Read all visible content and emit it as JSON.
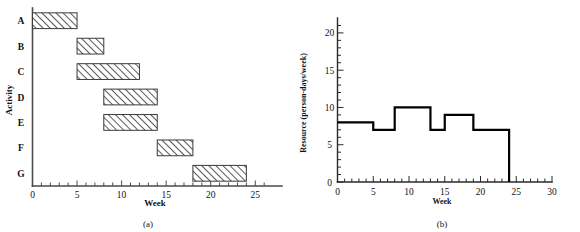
{
  "figure": {
    "panel_a_caption": "(a)",
    "panel_b_caption": "(b)"
  },
  "chart_data": [
    {
      "type": "bar",
      "orientation": "horizontal",
      "subtype": "gantt",
      "title": "",
      "caption": "(a)",
      "xlabel": "Week",
      "ylabel": "Activity",
      "xlim": [
        0,
        28
      ],
      "ylim": [
        0,
        7
      ],
      "grid": false,
      "legend": null,
      "x_ticks_major": [
        0,
        5,
        10,
        15,
        20,
        25
      ],
      "x_tick_labels": [
        "0",
        "5",
        "10",
        "15",
        "20",
        "25"
      ],
      "x_tick_minor_step": 1,
      "categories": [
        "A",
        "B",
        "C",
        "D",
        "E",
        "F",
        "G"
      ],
      "bars": [
        {
          "activity": "A",
          "start": 0,
          "end": 5,
          "duration": 5
        },
        {
          "activity": "B",
          "start": 5,
          "end": 8,
          "duration": 3
        },
        {
          "activity": "C",
          "start": 5,
          "end": 12,
          "duration": 7
        },
        {
          "activity": "D",
          "start": 8,
          "end": 14,
          "duration": 6
        },
        {
          "activity": "E",
          "start": 8,
          "end": 14,
          "duration": 6
        },
        {
          "activity": "F",
          "start": 14,
          "end": 18,
          "duration": 4
        },
        {
          "activity": "G",
          "start": 18,
          "end": 24,
          "duration": 6
        }
      ],
      "bar_fill": "hatched-diagonal",
      "bar_stroke_color": "#3a3a3a"
    },
    {
      "type": "line",
      "subtype": "step",
      "title": "",
      "caption": "(b)",
      "xlabel": "Week",
      "ylabel": "Resource (person-days/week)",
      "xlim": [
        0,
        30
      ],
      "ylim": [
        0,
        22
      ],
      "grid": false,
      "legend": null,
      "x_ticks_major": [
        0,
        5,
        10,
        15,
        20,
        25,
        30
      ],
      "x_tick_labels": [
        "0",
        "5",
        "10",
        "15",
        "20",
        "25",
        "30"
      ],
      "x_tick_minor_step": 1,
      "y_ticks_major": [
        0,
        5,
        10,
        15,
        20
      ],
      "y_tick_labels": [
        "0",
        "5",
        "10",
        "15",
        "20"
      ],
      "y_tick_minor_step": 1,
      "steps": [
        {
          "start": 0,
          "end": 5,
          "value": 8
        },
        {
          "start": 5,
          "end": 8,
          "value": 7
        },
        {
          "start": 8,
          "end": 13,
          "value": 10
        },
        {
          "start": 13,
          "end": 15,
          "value": 7
        },
        {
          "start": 15,
          "end": 19,
          "value": 9
        },
        {
          "start": 19,
          "end": 24,
          "value": 7
        },
        {
          "start": 24,
          "end": 24,
          "value": 0
        }
      ],
      "line_color": "#000000"
    }
  ]
}
